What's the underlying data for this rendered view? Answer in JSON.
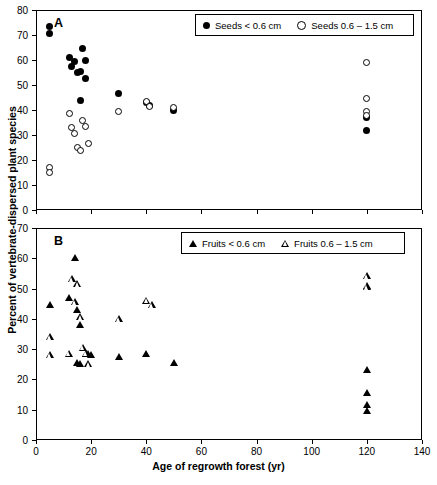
{
  "axes": {
    "ylabel": "Percent of vertebrate-dispersed plant species",
    "xlabel": "Age of regrowth forest (yr)",
    "x_ticks": [
      0,
      20,
      40,
      60,
      80,
      100,
      120,
      140
    ],
    "y_ticks_a": [
      0,
      10,
      20,
      30,
      40,
      50,
      60,
      70,
      80
    ],
    "y_ticks_b": [
      0,
      10,
      20,
      30,
      40,
      50,
      60,
      70
    ]
  },
  "panel_a": {
    "letter": "A",
    "legend": [
      {
        "label": "Seeds < 0.6 cm",
        "marker": "filled-circle"
      },
      {
        "label": "Seeds 0.6 – 1.5 cm",
        "marker": "open-circle"
      }
    ]
  },
  "panel_b": {
    "letter": "B",
    "legend": [
      {
        "label": "Fruits < 0.6 cm",
        "marker": "filled-triangle"
      },
      {
        "label": "Fruits 0.6 – 1.5 cm",
        "marker": "open-triangle"
      }
    ]
  },
  "chart_data": [
    {
      "type": "scatter",
      "panel": "A",
      "title": "",
      "xlabel": "Age of regrowth forest (yr)",
      "ylabel": "Percent of vertebrate-dispersed plant species",
      "xlim": [
        0,
        140
      ],
      "ylim": [
        0,
        80
      ],
      "grid": false,
      "legend_position": "top-right",
      "series": [
        {
          "name": "Seeds < 0.6 cm",
          "marker": "filled-circle",
          "points": [
            [
              5,
              73.5
            ],
            [
              5,
              70.5
            ],
            [
              12,
              61.0
            ],
            [
              13,
              57.5
            ],
            [
              14,
              59.5
            ],
            [
              15,
              55.0
            ],
            [
              16,
              55.5
            ],
            [
              17,
              64.5
            ],
            [
              18,
              60.0
            ],
            [
              18,
              52.5
            ],
            [
              16,
              44.0
            ],
            [
              30,
              46.5
            ],
            [
              40,
              43.0
            ],
            [
              41,
              42.0
            ],
            [
              50,
              40.0
            ],
            [
              120,
              37.0
            ],
            [
              120,
              32.0
            ]
          ]
        },
        {
          "name": "Seeds 0.6 – 1.5 cm",
          "marker": "open-circle",
          "points": [
            [
              5,
              17.0
            ],
            [
              5,
              15.0
            ],
            [
              12,
              38.5
            ],
            [
              13,
              33.0
            ],
            [
              14,
              30.5
            ],
            [
              15,
              25.0
            ],
            [
              16,
              24.0
            ],
            [
              17,
              36.0
            ],
            [
              18,
              33.5
            ],
            [
              19,
              26.5
            ],
            [
              30,
              39.5
            ],
            [
              40,
              43.5
            ],
            [
              41,
              41.5
            ],
            [
              50,
              41.0
            ],
            [
              120,
              59.0
            ],
            [
              120,
              44.5
            ],
            [
              120,
              39.5
            ],
            [
              120,
              38.0
            ]
          ]
        }
      ]
    },
    {
      "type": "scatter",
      "panel": "B",
      "title": "",
      "xlabel": "Age of regrowth forest (yr)",
      "ylabel": "Percent of vertebrate-dispersed plant species",
      "xlim": [
        0,
        140
      ],
      "ylim": [
        0,
        70
      ],
      "grid": false,
      "legend_position": "top-right",
      "series": [
        {
          "name": "Fruits < 0.6 cm",
          "marker": "filled-triangle",
          "points": [
            [
              5,
              44.5
            ],
            [
              12,
              47.0
            ],
            [
              14,
              60.0
            ],
            [
              15,
              43.0
            ],
            [
              16,
              38.0
            ],
            [
              15,
              25.5
            ],
            [
              16,
              25.0
            ],
            [
              18,
              28.5
            ],
            [
              19,
              28.5
            ],
            [
              20,
              28.0
            ],
            [
              30,
              27.5
            ],
            [
              40,
              28.5
            ],
            [
              50,
              25.5
            ],
            [
              120,
              23.0
            ],
            [
              120,
              15.5
            ],
            [
              120,
              11.5
            ],
            [
              120,
              9.5
            ]
          ]
        },
        {
          "name": "Fruits 0.6 – 1.5 cm",
          "marker": "open-triangle",
          "points": [
            [
              5,
              34.0
            ],
            [
              5,
              28.0
            ],
            [
              12,
              28.5
            ],
            [
              13,
              53.0
            ],
            [
              14,
              45.5
            ],
            [
              15,
              51.5
            ],
            [
              16,
              40.5
            ],
            [
              17,
              30.5
            ],
            [
              18,
              28.5
            ],
            [
              19,
              25.0
            ],
            [
              30,
              40.0
            ],
            [
              40,
              46.0
            ],
            [
              42,
              44.5
            ],
            [
              120,
              63.5
            ],
            [
              120,
              54.0
            ],
            [
              120,
              51.0
            ],
            [
              120,
              50.5
            ]
          ]
        }
      ]
    }
  ]
}
